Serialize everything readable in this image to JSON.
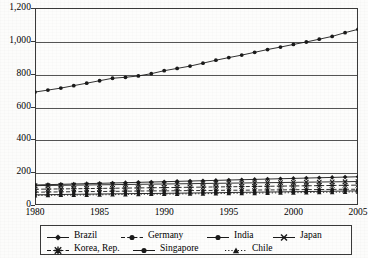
{
  "chart_data": {
    "type": "line",
    "title": "",
    "xlabel": "",
    "ylabel": "",
    "grid": true,
    "legend_position": "bottom",
    "xlim": [
      1980,
      2005
    ],
    "ylim": [
      0,
      1200
    ],
    "x": [
      1980,
      1981,
      1982,
      1983,
      1984,
      1985,
      1986,
      1987,
      1988,
      1989,
      1990,
      1991,
      1992,
      1993,
      1994,
      1995,
      1996,
      1997,
      1998,
      1999,
      2000,
      2001,
      2002,
      2003,
      2004,
      2005
    ],
    "xticks": [
      "1980",
      "1985",
      "1990",
      "1995",
      "2000",
      "2005"
    ],
    "xtick_values": [
      1980,
      1985,
      1990,
      1995,
      2000,
      2005
    ],
    "yticks": [
      "0",
      "200",
      "400",
      "600",
      "800",
      "1,000",
      "1,200"
    ],
    "ytick_values": [
      0,
      200,
      400,
      600,
      800,
      1000,
      1200
    ],
    "series": [
      {
        "name": "Brazil",
        "marker": "diamond",
        "dash": "solid",
        "values": [
          122,
          124,
          126,
          128,
          130,
          132,
          134,
          136,
          138,
          140,
          142,
          144,
          146,
          148,
          150,
          152,
          154,
          156,
          158,
          160,
          162,
          164,
          166,
          168,
          170,
          172
        ]
      },
      {
        "name": "Germany",
        "marker": "circle",
        "dash": "dashed",
        "values": [
          78,
          79,
          80,
          81,
          82,
          82,
          83,
          84,
          85,
          86,
          86,
          87,
          88,
          88,
          89,
          90,
          90,
          91,
          92,
          92,
          93,
          94,
          94,
          95,
          96,
          96
        ]
      },
      {
        "name": "India",
        "marker": "circle",
        "dash": "solid",
        "values": [
          688,
          700,
          712,
          727,
          742,
          757,
          772,
          778,
          786,
          800,
          818,
          832,
          846,
          864,
          882,
          898,
          913,
          930,
          947,
          962,
          978,
          993,
          1010,
          1027,
          1050,
          1070
        ]
      },
      {
        "name": "Japan",
        "marker": "x",
        "dash": "solid",
        "values": [
          118,
          119,
          120,
          121,
          122,
          123,
          124,
          125,
          126,
          127,
          128,
          129,
          130,
          131,
          132,
          133,
          134,
          135,
          136,
          137,
          138,
          139,
          140,
          141,
          142,
          143
        ]
      },
      {
        "name": "Korea, Rep.",
        "marker": "star",
        "dash": "dashed",
        "values": [
          96,
          97,
          98,
          99,
          100,
          101,
          102,
          103,
          104,
          105,
          106,
          107,
          108,
          109,
          110,
          111,
          112,
          113,
          114,
          115,
          116,
          117,
          118,
          119,
          120,
          121
        ]
      },
      {
        "name": "Singapore",
        "marker": "filled-circle",
        "dash": "solid",
        "values": [
          62,
          63,
          64,
          65,
          66,
          67,
          68,
          69,
          70,
          70,
          71,
          72,
          73,
          74,
          75,
          76,
          77,
          78,
          79,
          80,
          81,
          82,
          83,
          84,
          85,
          86
        ]
      },
      {
        "name": "Chile",
        "marker": "triangle",
        "dash": "dotted",
        "values": [
          58,
          59,
          60,
          60,
          61,
          62,
          63,
          64,
          65,
          66,
          66,
          67,
          68,
          69,
          70,
          71,
          72,
          72,
          73,
          74,
          75,
          76,
          77,
          78,
          79,
          80
        ]
      }
    ]
  },
  "colors": {
    "line": "#1a1a1a",
    "grid": "#555555",
    "frame": "#3a3a3a",
    "background": "#fdfdfc"
  }
}
